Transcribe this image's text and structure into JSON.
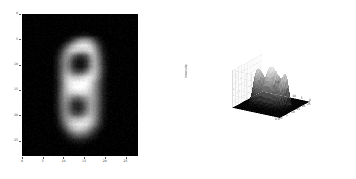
{
  "figure": {
    "background_color": "#ffffff",
    "panel_count": 2
  },
  "left_panel": {
    "name": "2d-grayscale-image",
    "plot_type": "image",
    "colormap": "gray",
    "background_color": "#000000",
    "subject": "handwritten digit 8 (blurred, MNIST-style)",
    "x_ticks": [
      "0",
      "5",
      "10",
      "15",
      "20",
      "25"
    ],
    "y_ticks": [
      "0",
      "5",
      "10",
      "15",
      "20",
      "25"
    ],
    "xlabel": "",
    "ylabel": "",
    "title": ""
  },
  "right_panel": {
    "name": "3d-surface-plot",
    "plot_type": "surface",
    "colormap": "gray",
    "subject": "intensity surface of handwritten digit 8",
    "zlabel": "intensity",
    "x_ticks": [
      "0",
      "5",
      "10",
      "15",
      "20",
      "25"
    ],
    "y_ticks": [
      "0",
      "5",
      "10",
      "15",
      "20",
      "25"
    ],
    "z_ticks": [
      "0.0",
      "0.5",
      "1.0"
    ],
    "grid": true,
    "pane_color": "#ffffff"
  },
  "chart_data": {
    "type": "heatmap",
    "title": "",
    "xlabel": "",
    "ylabel": "",
    "xlim": [
      0,
      28
    ],
    "ylim": [
      28,
      0
    ],
    "grid": false,
    "colormap": "gray",
    "xtick_values": [
      0,
      5,
      10,
      15,
      20,
      25
    ],
    "ytick_values": [
      0,
      5,
      10,
      15,
      20,
      25
    ],
    "digit_label": 8,
    "value_range": [
      0.0,
      1.0
    ],
    "panels": [
      {
        "name": "image",
        "type": "heatmap"
      },
      {
        "name": "surface",
        "type": "surface",
        "zlabel": "intensity",
        "zlim": [
          0.0,
          1.0
        ]
      }
    ],
    "values": [
      [
        0,
        0,
        0,
        0,
        0,
        0,
        0,
        0,
        0,
        0,
        0,
        0,
        0,
        0,
        0,
        0,
        0,
        0,
        0,
        0,
        0,
        0,
        0,
        0,
        0,
        0,
        0,
        0
      ],
      [
        0,
        0,
        0,
        0,
        0,
        0,
        0,
        0,
        0,
        0,
        0,
        0,
        0,
        0,
        0,
        0,
        0,
        0,
        0,
        0,
        0,
        0,
        0,
        0,
        0,
        0,
        0,
        0
      ],
      [
        0,
        0,
        0,
        0,
        0,
        0,
        0,
        0,
        0,
        0,
        0,
        0,
        0,
        0,
        0,
        0,
        0,
        0,
        0,
        0,
        0,
        0,
        0,
        0,
        0,
        0,
        0,
        0
      ],
      [
        0,
        0,
        0,
        0,
        0,
        0,
        0,
        0,
        0,
        0,
        0,
        0,
        0,
        0,
        0,
        0,
        0,
        0,
        0,
        0,
        0,
        0,
        0,
        0,
        0,
        0,
        0,
        0
      ],
      [
        0,
        0,
        0,
        0,
        0,
        0,
        0,
        0,
        0,
        0,
        0,
        0,
        0.02,
        0.05,
        0.08,
        0.08,
        0.05,
        0.02,
        0,
        0,
        0,
        0,
        0,
        0,
        0,
        0,
        0,
        0
      ],
      [
        0,
        0,
        0,
        0,
        0,
        0,
        0,
        0,
        0,
        0,
        0.03,
        0.12,
        0.3,
        0.5,
        0.62,
        0.62,
        0.5,
        0.28,
        0.1,
        0.02,
        0,
        0,
        0,
        0,
        0,
        0,
        0,
        0
      ],
      [
        0,
        0,
        0,
        0,
        0,
        0,
        0,
        0,
        0,
        0.05,
        0.22,
        0.48,
        0.72,
        0.86,
        0.92,
        0.9,
        0.78,
        0.52,
        0.24,
        0.06,
        0,
        0,
        0,
        0,
        0,
        0,
        0,
        0
      ],
      [
        0,
        0,
        0,
        0,
        0,
        0,
        0,
        0,
        0.04,
        0.18,
        0.45,
        0.7,
        0.8,
        0.78,
        0.76,
        0.8,
        0.84,
        0.66,
        0.34,
        0.1,
        0.01,
        0,
        0,
        0,
        0,
        0,
        0,
        0
      ],
      [
        0,
        0,
        0,
        0,
        0,
        0,
        0,
        0,
        0.08,
        0.28,
        0.52,
        0.58,
        0.4,
        0.24,
        0.22,
        0.34,
        0.62,
        0.68,
        0.42,
        0.14,
        0.02,
        0,
        0,
        0,
        0,
        0,
        0,
        0
      ],
      [
        0,
        0,
        0,
        0,
        0,
        0,
        0,
        0,
        0.1,
        0.32,
        0.52,
        0.46,
        0.2,
        0.08,
        0.08,
        0.2,
        0.52,
        0.68,
        0.46,
        0.16,
        0.03,
        0,
        0,
        0,
        0,
        0,
        0,
        0
      ],
      [
        0,
        0,
        0,
        0,
        0,
        0,
        0,
        0,
        0.1,
        0.32,
        0.52,
        0.46,
        0.2,
        0.08,
        0.08,
        0.22,
        0.54,
        0.7,
        0.48,
        0.18,
        0.03,
        0,
        0,
        0,
        0,
        0,
        0,
        0
      ],
      [
        0,
        0,
        0,
        0,
        0,
        0,
        0,
        0,
        0.1,
        0.34,
        0.58,
        0.58,
        0.38,
        0.28,
        0.32,
        0.5,
        0.72,
        0.74,
        0.5,
        0.18,
        0.03,
        0,
        0,
        0,
        0,
        0,
        0,
        0
      ],
      [
        0,
        0,
        0,
        0,
        0,
        0,
        0,
        0,
        0.1,
        0.36,
        0.66,
        0.8,
        0.76,
        0.74,
        0.8,
        0.88,
        0.88,
        0.74,
        0.46,
        0.16,
        0.02,
        0,
        0,
        0,
        0,
        0,
        0,
        0
      ],
      [
        0,
        0,
        0,
        0,
        0,
        0,
        0,
        0,
        0.08,
        0.34,
        0.68,
        0.88,
        0.96,
        0.98,
        1.0,
        0.98,
        0.86,
        0.62,
        0.36,
        0.12,
        0.02,
        0,
        0,
        0,
        0,
        0,
        0,
        0
      ],
      [
        0,
        0,
        0,
        0,
        0,
        0,
        0,
        0,
        0.08,
        0.34,
        0.66,
        0.88,
        0.98,
        1.0,
        1.0,
        0.94,
        0.8,
        0.58,
        0.34,
        0.12,
        0.02,
        0,
        0,
        0,
        0,
        0,
        0,
        0
      ],
      [
        0,
        0,
        0,
        0,
        0,
        0,
        0,
        0,
        0.1,
        0.36,
        0.64,
        0.78,
        0.82,
        0.84,
        0.86,
        0.84,
        0.74,
        0.56,
        0.34,
        0.12,
        0.02,
        0,
        0,
        0,
        0,
        0,
        0,
        0
      ],
      [
        0,
        0,
        0,
        0,
        0,
        0,
        0,
        0,
        0.1,
        0.36,
        0.58,
        0.56,
        0.44,
        0.4,
        0.48,
        0.6,
        0.66,
        0.56,
        0.34,
        0.12,
        0.02,
        0,
        0,
        0,
        0,
        0,
        0,
        0
      ],
      [
        0,
        0,
        0,
        0,
        0,
        0,
        0,
        0,
        0.1,
        0.34,
        0.52,
        0.42,
        0.22,
        0.16,
        0.26,
        0.46,
        0.62,
        0.54,
        0.32,
        0.11,
        0.02,
        0,
        0,
        0,
        0,
        0,
        0,
        0
      ],
      [
        0,
        0,
        0,
        0,
        0,
        0,
        0,
        0,
        0.09,
        0.32,
        0.5,
        0.4,
        0.2,
        0.12,
        0.22,
        0.44,
        0.62,
        0.54,
        0.32,
        0.11,
        0.02,
        0,
        0,
        0,
        0,
        0,
        0,
        0
      ],
      [
        0,
        0,
        0,
        0,
        0,
        0,
        0,
        0,
        0.08,
        0.3,
        0.52,
        0.48,
        0.34,
        0.28,
        0.38,
        0.56,
        0.68,
        0.56,
        0.32,
        0.1,
        0.02,
        0,
        0,
        0,
        0,
        0,
        0,
        0
      ],
      [
        0,
        0,
        0,
        0,
        0,
        0,
        0,
        0,
        0.06,
        0.26,
        0.52,
        0.66,
        0.7,
        0.7,
        0.76,
        0.82,
        0.76,
        0.56,
        0.3,
        0.09,
        0.01,
        0,
        0,
        0,
        0,
        0,
        0,
        0
      ],
      [
        0,
        0,
        0,
        0,
        0,
        0,
        0,
        0,
        0.03,
        0.18,
        0.44,
        0.68,
        0.84,
        0.9,
        0.92,
        0.86,
        0.7,
        0.46,
        0.22,
        0.06,
        0,
        0,
        0,
        0,
        0,
        0,
        0,
        0
      ],
      [
        0,
        0,
        0,
        0,
        0,
        0,
        0,
        0,
        0.01,
        0.08,
        0.26,
        0.5,
        0.68,
        0.76,
        0.74,
        0.64,
        0.46,
        0.26,
        0.1,
        0.02,
        0,
        0,
        0,
        0,
        0,
        0,
        0,
        0
      ],
      [
        0,
        0,
        0,
        0,
        0,
        0,
        0,
        0,
        0,
        0.02,
        0.09,
        0.22,
        0.36,
        0.44,
        0.42,
        0.34,
        0.22,
        0.1,
        0.03,
        0,
        0,
        0,
        0,
        0,
        0,
        0,
        0,
        0
      ],
      [
        0,
        0,
        0,
        0,
        0,
        0,
        0,
        0,
        0,
        0,
        0.02,
        0.06,
        0.11,
        0.14,
        0.13,
        0.1,
        0.06,
        0.02,
        0,
        0,
        0,
        0,
        0,
        0,
        0,
        0,
        0,
        0
      ],
      [
        0,
        0,
        0,
        0,
        0,
        0,
        0,
        0,
        0,
        0,
        0,
        0,
        0.01,
        0.02,
        0.02,
        0.01,
        0,
        0,
        0,
        0,
        0,
        0,
        0,
        0,
        0,
        0,
        0,
        0
      ],
      [
        0,
        0,
        0,
        0,
        0,
        0,
        0,
        0,
        0,
        0,
        0,
        0,
        0,
        0,
        0,
        0,
        0,
        0,
        0,
        0,
        0,
        0,
        0,
        0,
        0,
        0,
        0,
        0
      ],
      [
        0,
        0,
        0,
        0,
        0,
        0,
        0,
        0,
        0,
        0,
        0,
        0,
        0,
        0,
        0,
        0,
        0,
        0,
        0,
        0,
        0,
        0,
        0,
        0,
        0,
        0,
        0,
        0
      ]
    ]
  }
}
